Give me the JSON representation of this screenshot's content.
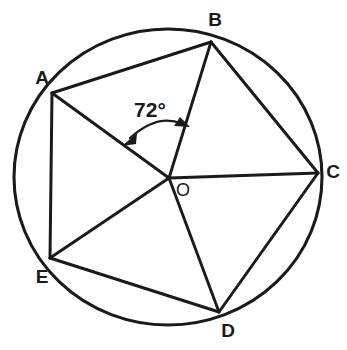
{
  "diagram": {
    "stroke_color": "#1a1a1a",
    "background_color": "#ffffff",
    "circle": {
      "center_label": "O",
      "center_x": 168,
      "center_y": 177,
      "radius_x": 154,
      "radius_y": 148
    },
    "vertices": [
      {
        "label": "A",
        "x": 52,
        "y": 93,
        "label_x": 42,
        "label_y": 79
      },
      {
        "label": "B",
        "x": 211,
        "y": 42,
        "label_x": 215,
        "label_y": 21
      },
      {
        "label": "C",
        "x": 318,
        "y": 173,
        "label_x": 333,
        "label_y": 173
      },
      {
        "label": "D",
        "x": 219,
        "y": 312,
        "label_x": 228,
        "label_y": 332
      },
      {
        "label": "E",
        "x": 50,
        "y": 258,
        "label_x": 42,
        "label_y": 278
      }
    ],
    "center_point": {
      "label": "O",
      "x": 169,
      "y": 178,
      "label_x": 183,
      "label_y": 191
    },
    "radii": [
      {
        "name": "radius-OA",
        "from": "O",
        "to": "A",
        "x1": 169,
        "y1": 178,
        "x2": 52,
        "y2": 93
      },
      {
        "name": "radius-OB",
        "from": "O",
        "to": "B",
        "x1": 169,
        "y1": 178,
        "x2": 211,
        "y2": 42
      },
      {
        "name": "radius-OC",
        "from": "O",
        "to": "C",
        "x1": 169,
        "y1": 178,
        "x2": 318,
        "y2": 173
      },
      {
        "name": "radius-OD",
        "from": "O",
        "to": "D",
        "x1": 169,
        "y1": 178,
        "x2": 219,
        "y2": 312
      },
      {
        "name": "radius-OE",
        "from": "O",
        "to": "E",
        "x1": 169,
        "y1": 178,
        "x2": 50,
        "y2": 258
      }
    ],
    "chords": [
      {
        "name": "chord-AB",
        "from": "A",
        "to": "B",
        "x1": 52,
        "y1": 93,
        "x2": 211,
        "y2": 42
      },
      {
        "name": "chord-BC",
        "from": "B",
        "to": "C",
        "x1": 211,
        "y1": 42,
        "x2": 318,
        "y2": 173
      },
      {
        "name": "chord-CD",
        "from": "C",
        "to": "D",
        "x1": 318,
        "y1": 173,
        "x2": 219,
        "y2": 312
      },
      {
        "name": "chord-DE",
        "from": "D",
        "to": "E",
        "x1": 219,
        "y1": 312,
        "x2": 50,
        "y2": 258
      },
      {
        "name": "chord-EA",
        "from": "E",
        "to": "A",
        "x1": 50,
        "y1": 258,
        "x2": 52,
        "y2": 93
      }
    ],
    "angle_annotation": {
      "value": "72°",
      "measure": 72,
      "unit": "degrees",
      "between": [
        "OA",
        "OB"
      ],
      "label_x": 150,
      "label_y": 111,
      "arc_path": "M 126 141 Q 158 112 185 123",
      "arrow_start": {
        "x": 126,
        "y": 141,
        "angle": 140
      },
      "arrow_end": {
        "x": 185,
        "y": 123,
        "angle": 22
      }
    }
  }
}
